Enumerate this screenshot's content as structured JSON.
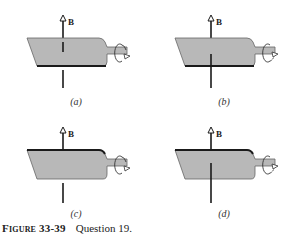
{
  "figure": {
    "field_label": "B",
    "panels": [
      {
        "id": "a",
        "label": "(a)",
        "thick_edge": "bottom"
      },
      {
        "id": "b",
        "label": "(b)",
        "thick_edge": "bottom"
      },
      {
        "id": "c",
        "label": "(c)",
        "thick_edge": "top"
      },
      {
        "id": "d",
        "label": "(d)",
        "thick_edge": "top"
      }
    ],
    "colors": {
      "plate_fill": "#b8b8b8",
      "line": "#1a1a1a",
      "plate_edge": "#555555"
    }
  },
  "caption": {
    "figure_number": "Figure 33-39",
    "text": "Question 19."
  }
}
